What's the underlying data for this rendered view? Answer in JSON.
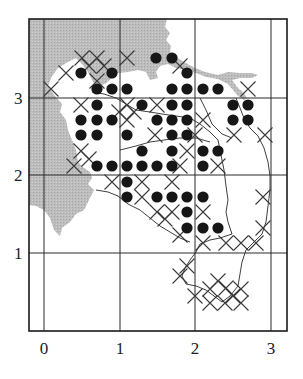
{
  "figure": {
    "type": "distribution grid map",
    "frame": {
      "left": 29,
      "top": 19,
      "right": 287,
      "bottom": 331
    },
    "colors": {
      "land": "#b9b9b9",
      "water": "#ffffff",
      "line": "#2a2a2a",
      "dot": "#161616",
      "cross": "#3a3a3a"
    },
    "axes": {
      "x_ticks": [
        {
          "label": "0",
          "px": 44
        },
        {
          "label": "1",
          "px": 120
        },
        {
          "label": "2",
          "px": 195
        },
        {
          "label": "3",
          "px": 271
        }
      ],
      "y_ticks": [
        {
          "label": "3",
          "px": 98
        },
        {
          "label": "2",
          "px": 175
        },
        {
          "label": "1",
          "px": 253
        }
      ]
    },
    "legend": null
  },
  "markers": {
    "dots": [
      [
        156,
        58
      ],
      [
        172,
        58
      ],
      [
        81,
        73
      ],
      [
        112,
        73
      ],
      [
        187,
        73
      ],
      [
        97,
        89
      ],
      [
        112,
        89
      ],
      [
        127,
        89
      ],
      [
        172,
        89
      ],
      [
        187,
        89
      ],
      [
        203,
        89
      ],
      [
        218,
        89
      ],
      [
        97,
        105
      ],
      [
        142,
        105
      ],
      [
        172,
        105
      ],
      [
        187,
        105
      ],
      [
        233,
        105
      ],
      [
        248,
        105
      ],
      [
        81,
        120
      ],
      [
        97,
        120
      ],
      [
        112,
        120
      ],
      [
        157,
        120
      ],
      [
        172,
        120
      ],
      [
        187,
        120
      ],
      [
        233,
        120
      ],
      [
        248,
        120
      ],
      [
        81,
        135
      ],
      [
        97,
        135
      ],
      [
        127,
        135
      ],
      [
        172,
        135
      ],
      [
        187,
        135
      ],
      [
        142,
        151
      ],
      [
        172,
        151
      ],
      [
        203,
        151
      ],
      [
        218,
        151
      ],
      [
        97,
        166
      ],
      [
        112,
        166
      ],
      [
        127,
        166
      ],
      [
        142,
        166
      ],
      [
        157,
        166
      ],
      [
        172,
        166
      ],
      [
        203,
        166
      ],
      [
        127,
        182
      ],
      [
        127,
        197
      ],
      [
        157,
        197
      ],
      [
        172,
        197
      ],
      [
        187,
        197
      ],
      [
        203,
        197
      ],
      [
        187,
        212
      ],
      [
        187,
        228
      ],
      [
        203,
        228
      ],
      [
        218,
        228
      ]
    ],
    "crosses": [
      [
        82,
        58
      ],
      [
        97,
        58
      ],
      [
        89,
        66
      ],
      [
        104,
        66
      ],
      [
        127,
        58
      ],
      [
        66,
        73
      ],
      [
        97,
        81
      ],
      [
        180,
        66
      ],
      [
        51,
        89
      ],
      [
        248,
        89
      ],
      [
        81,
        105
      ],
      [
        127,
        105
      ],
      [
        157,
        105
      ],
      [
        119,
        112
      ],
      [
        134,
        112
      ],
      [
        127,
        120
      ],
      [
        203,
        120
      ],
      [
        155,
        135
      ],
      [
        195,
        135
      ],
      [
        234,
        135
      ],
      [
        265,
        135
      ],
      [
        81,
        151
      ],
      [
        89,
        159
      ],
      [
        74,
        166
      ],
      [
        112,
        182
      ],
      [
        187,
        151
      ],
      [
        180,
        166
      ],
      [
        218,
        166
      ],
      [
        142,
        182
      ],
      [
        172,
        182
      ],
      [
        142,
        197
      ],
      [
        157,
        212
      ],
      [
        172,
        212
      ],
      [
        165,
        219
      ],
      [
        203,
        212
      ],
      [
        180,
        235
      ],
      [
        203,
        243
      ],
      [
        226,
        243
      ],
      [
        241,
        243
      ],
      [
        256,
        243
      ],
      [
        263,
        228
      ],
      [
        263,
        197
      ],
      [
        187,
        266
      ],
      [
        180,
        276
      ],
      [
        218,
        281
      ],
      [
        226,
        288
      ],
      [
        210,
        289
      ],
      [
        233,
        296
      ],
      [
        210,
        303
      ],
      [
        225,
        303
      ],
      [
        241,
        289
      ],
      [
        241,
        303
      ],
      [
        195,
        296
      ]
    ]
  }
}
